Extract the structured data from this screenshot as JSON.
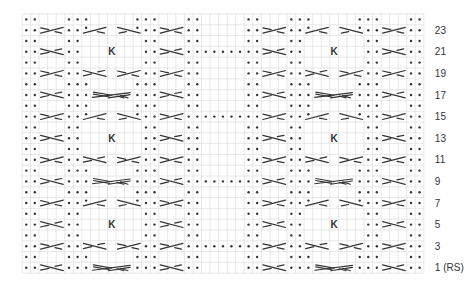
{
  "chart": {
    "grid": {
      "left": 22,
      "top": 14,
      "cell_w": 8.55,
      "cell_h": 10.8,
      "cols": 47,
      "rows": 24
    },
    "colors": {
      "grid": "#d9d9d9",
      "grid_outer": "#cccccc",
      "symbol": "#333333",
      "label": "#333333"
    },
    "panel_width": 21,
    "gap_width": 5,
    "panels": [
      {
        "start_col": 0
      },
      {
        "start_col": 26
      }
    ],
    "gap_start_col": 21,
    "gap_dot_rows": [
      21,
      15,
      9,
      3
    ],
    "row_types": {
      "A": [
        {
          "c": 0,
          "t": "p"
        },
        {
          "c": 1,
          "t": "p"
        },
        {
          "c": 5,
          "t": "p"
        },
        {
          "c": 6,
          "t": "p"
        },
        {
          "c": 7,
          "t": "p"
        },
        {
          "c": 13,
          "t": "p"
        },
        {
          "c": 14,
          "t": "p"
        },
        {
          "c": 15,
          "t": "p"
        },
        {
          "c": 19,
          "t": "p"
        },
        {
          "c": 20,
          "t": "p"
        }
      ],
      "B": [
        {
          "c": 0,
          "t": "p"
        },
        {
          "c": 1,
          "t": "p"
        },
        {
          "c": 5,
          "t": "p"
        },
        {
          "c": 6,
          "t": "p"
        },
        {
          "c": 14,
          "t": "p"
        },
        {
          "c": 15,
          "t": "p"
        },
        {
          "c": 19,
          "t": "p"
        },
        {
          "c": 20,
          "t": "p"
        }
      ],
      "C": [
        {
          "c": 0,
          "t": "p"
        },
        {
          "c": 1,
          "t": "p"
        },
        {
          "c": 2,
          "t": "cR",
          "w": 3
        },
        {
          "c": 5,
          "t": "p"
        },
        {
          "c": 6,
          "t": "p"
        },
        {
          "c": 7,
          "t": "cRdot",
          "w": 3
        },
        {
          "c": 11,
          "t": "cLdot",
          "w": 3
        },
        {
          "c": 14,
          "t": "p"
        },
        {
          "c": 15,
          "t": "p"
        },
        {
          "c": 16,
          "t": "cR",
          "w": 3
        },
        {
          "c": 19,
          "t": "p"
        },
        {
          "c": 20,
          "t": "p"
        }
      ],
      "D": [
        {
          "c": 0,
          "t": "p"
        },
        {
          "c": 1,
          "t": "p"
        },
        {
          "c": 2,
          "t": "cL",
          "w": 3
        },
        {
          "c": 5,
          "t": "p"
        },
        {
          "c": 6,
          "t": "p"
        },
        {
          "c": 10,
          "t": "K"
        },
        {
          "c": 14,
          "t": "p"
        },
        {
          "c": 15,
          "t": "p"
        },
        {
          "c": 16,
          "t": "cL",
          "w": 3
        },
        {
          "c": 19,
          "t": "p"
        },
        {
          "c": 20,
          "t": "p"
        }
      ],
      "E": [
        {
          "c": 0,
          "t": "p"
        },
        {
          "c": 1,
          "t": "p"
        },
        {
          "c": 2,
          "t": "cR",
          "w": 3
        },
        {
          "c": 5,
          "t": "p"
        },
        {
          "c": 6,
          "t": "p"
        },
        {
          "c": 7,
          "t": "cL",
          "w": 3
        },
        {
          "c": 11,
          "t": "cR",
          "w": 3
        },
        {
          "c": 14,
          "t": "p"
        },
        {
          "c": 15,
          "t": "p"
        },
        {
          "c": 16,
          "t": "cR",
          "w": 3
        },
        {
          "c": 19,
          "t": "p"
        },
        {
          "c": 20,
          "t": "p"
        }
      ],
      "F": [
        {
          "c": 0,
          "t": "p"
        },
        {
          "c": 1,
          "t": "p"
        },
        {
          "c": 2,
          "t": "cL",
          "w": 3
        },
        {
          "c": 5,
          "t": "p"
        },
        {
          "c": 6,
          "t": "p"
        },
        {
          "c": 7,
          "t": "p"
        },
        {
          "c": 8,
          "t": "wide",
          "w": 5
        },
        {
          "c": 13,
          "t": "p"
        },
        {
          "c": 14,
          "t": "p"
        },
        {
          "c": 15,
          "t": "p"
        },
        {
          "c": 16,
          "t": "cL",
          "w": 3
        },
        {
          "c": 19,
          "t": "p"
        },
        {
          "c": 20,
          "t": "p"
        }
      ]
    },
    "rows": [
      {
        "n": 24,
        "type": "A"
      },
      {
        "n": 23,
        "type": "C"
      },
      {
        "n": 22,
        "type": "B"
      },
      {
        "n": 21,
        "type": "D"
      },
      {
        "n": 20,
        "type": "B"
      },
      {
        "n": 19,
        "type": "E"
      },
      {
        "n": 18,
        "type": "A"
      },
      {
        "n": 17,
        "type": "F"
      },
      {
        "n": 16,
        "type": "A"
      },
      {
        "n": 15,
        "type": "C"
      },
      {
        "n": 14,
        "type": "B"
      },
      {
        "n": 13,
        "type": "D"
      },
      {
        "n": 12,
        "type": "B"
      },
      {
        "n": 11,
        "type": "E"
      },
      {
        "n": 10,
        "type": "A"
      },
      {
        "n": 9,
        "type": "F"
      },
      {
        "n": 8,
        "type": "A"
      },
      {
        "n": 7,
        "type": "C"
      },
      {
        "n": 6,
        "type": "B"
      },
      {
        "n": 5,
        "type": "D"
      },
      {
        "n": 4,
        "type": "B"
      },
      {
        "n": 3,
        "type": "E"
      },
      {
        "n": 2,
        "type": "A"
      },
      {
        "n": 1,
        "type": "F"
      }
    ],
    "k_label": "K",
    "row_labels": [
      {
        "row": 23,
        "text": "23"
      },
      {
        "row": 21,
        "text": "21"
      },
      {
        "row": 19,
        "text": "19"
      },
      {
        "row": 17,
        "text": "17"
      },
      {
        "row": 15,
        "text": "15"
      },
      {
        "row": 13,
        "text": "13"
      },
      {
        "row": 11,
        "text": "11"
      },
      {
        "row": 9,
        "text": "9"
      },
      {
        "row": 7,
        "text": "7"
      },
      {
        "row": 5,
        "text": "5"
      },
      {
        "row": 3,
        "text": "3"
      },
      {
        "row": 1,
        "text": "1 (RS)"
      }
    ]
  }
}
